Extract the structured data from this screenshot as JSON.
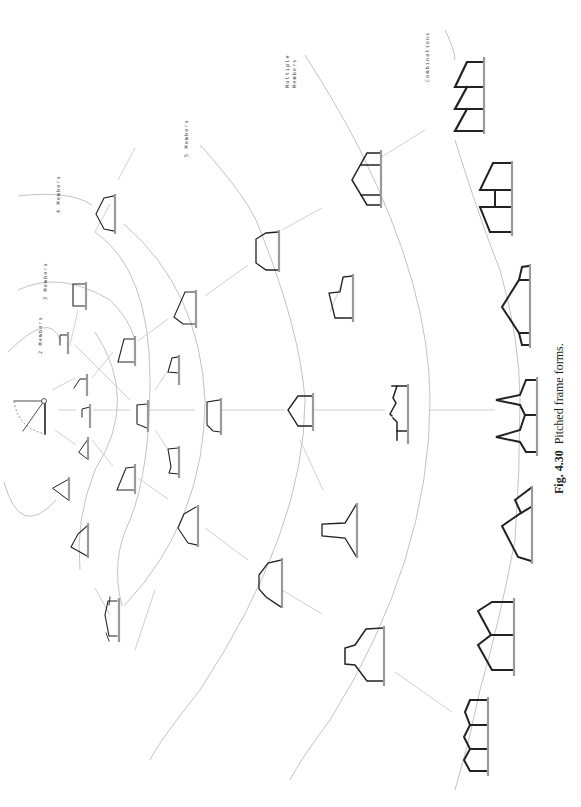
{
  "figure": {
    "number": "Fig. 4.30",
    "title": "Pitched frame forms.",
    "orientation": "rotated 90° (ground line on right side)"
  },
  "levels": [
    {
      "id": "2m",
      "label": "2 Members",
      "label_pos": [
        36,
        372
      ]
    },
    {
      "id": "3m",
      "label": "3 Members",
      "label_pos": [
        40,
        296
      ]
    },
    {
      "id": "4m",
      "label": "4 Members",
      "label_pos": [
        58,
        210
      ]
    },
    {
      "id": "5m",
      "label": "5 Members",
      "label_pos": [
        186,
        158
      ]
    },
    {
      "id": "mm",
      "label": "Multiple Members",
      "label_pos": [
        286,
        94
      ]
    },
    {
      "id": "cb",
      "label": "Combinations",
      "label_pos": [
        426,
        86
      ]
    }
  ],
  "colors": {
    "frame": "#222222",
    "ground": "#9a9a9a",
    "arc": "#b4b4b4",
    "background": "#ffffff"
  },
  "origin": {
    "label": "single pivot member",
    "x": 130,
    "y": 400
  },
  "frames_count": 31
}
